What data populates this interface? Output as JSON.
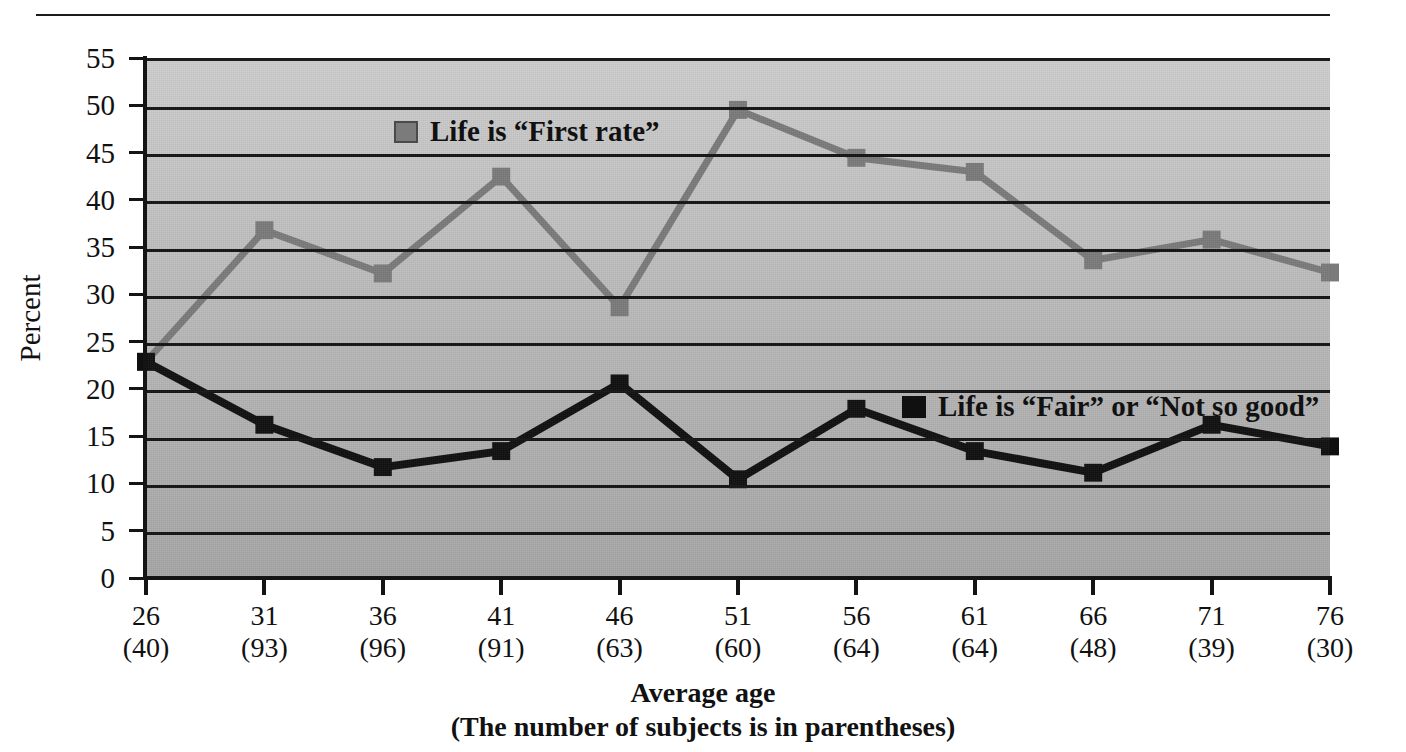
{
  "chart_data": {
    "type": "line",
    "title": "",
    "xlabel": "Average age",
    "xlabel_note": "(The number of subjects is in parentheses)",
    "ylabel": "Percent",
    "ylim": [
      0,
      55
    ],
    "ytick_step": 5,
    "grid": true,
    "legend_position": "inside-plot",
    "categories": [
      "26",
      "31",
      "36",
      "41",
      "46",
      "51",
      "56",
      "61",
      "66",
      "71",
      "76"
    ],
    "subject_counts": [
      "(40)",
      "(93)",
      "(96)",
      "(91)",
      "(63)",
      "(60)",
      "(64)",
      "(64)",
      "(48)",
      "(39)",
      "(30)"
    ],
    "yticks": [
      "0",
      "5",
      "10",
      "15",
      "20",
      "25",
      "30",
      "35",
      "40",
      "45",
      "50",
      "55"
    ],
    "series": [
      {
        "name": "Life is “First rate”",
        "color": "#7b7b7b",
        "marker": "square",
        "values": [
          23.0,
          37.0,
          32.4,
          42.7,
          28.8,
          49.8,
          44.7,
          43.2,
          33.8,
          36.0,
          32.5
        ]
      },
      {
        "name": "Life is “Fair” or “Not so good”",
        "color": "#101010",
        "marker": "square",
        "values": [
          23.0,
          16.3,
          11.8,
          13.5,
          20.7,
          10.5,
          18.0,
          13.5,
          11.2,
          16.3,
          14.0
        ]
      }
    ]
  },
  "axis": {
    "y_title": "Percent",
    "x_title_line1": "Average age",
    "x_title_line2": "(The number of subjects is in parentheses)"
  },
  "legend": {
    "first_rate": "Life is “First rate”",
    "fair_or_not": "Life is “Fair” or “Not so good”"
  },
  "colors": {
    "series_first_rate": "#7b7b7b",
    "series_fair": "#101010",
    "plot_background_top": "#cfcfcf",
    "plot_background_bottom": "#a7a7a7",
    "gridline": "#141414",
    "axis": "#141414"
  }
}
